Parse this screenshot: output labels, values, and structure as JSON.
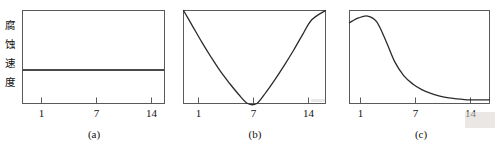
{
  "figure": {
    "y_axis_label": "腐蚀速度",
    "y_axis_label_chars": [
      "腐",
      "蚀",
      "速",
      "度"
    ]
  },
  "panels": [
    {
      "caption": "(a)",
      "tick_labels": [
        "1",
        "7",
        "14"
      ]
    },
    {
      "caption": "(b)",
      "tick_labels": [
        "1",
        "7",
        "14"
      ]
    },
    {
      "caption": "(c)",
      "tick_labels": [
        "1",
        "7",
        "14"
      ]
    }
  ],
  "chart_data": [
    {
      "type": "line",
      "title": "(a)",
      "xlabel": "pH",
      "ylabel": "腐蚀速度",
      "xticks": [
        1,
        7,
        14
      ],
      "xlim": [
        0,
        15.5
      ],
      "ylim": [
        0,
        1
      ],
      "grid": false,
      "legend": "none",
      "annotation": "corrosion rate independent of pH (constant)",
      "series": [
        {
          "name": "corrosion rate",
          "x": [
            0,
            1,
            2,
            3,
            4,
            5,
            6,
            7,
            8,
            9,
            10,
            11,
            12,
            13,
            14,
            15.5
          ],
          "values": [
            0.36,
            0.36,
            0.36,
            0.36,
            0.36,
            0.36,
            0.36,
            0.36,
            0.36,
            0.36,
            0.36,
            0.36,
            0.36,
            0.36,
            0.36,
            0.36
          ]
        }
      ]
    },
    {
      "type": "line",
      "title": "(b)",
      "xlabel": "pH",
      "ylabel": "腐蚀速度",
      "xticks": [
        1,
        7,
        14
      ],
      "xlim": [
        0,
        15.5
      ],
      "ylim": [
        0,
        1
      ],
      "grid": false,
      "legend": "none",
      "annotation": "U-shaped: minimum corrosion rate at neutral pH 7, rises in acid and alkali",
      "series": [
        {
          "name": "corrosion rate",
          "x": [
            0,
            1,
            2,
            3,
            4,
            5,
            6,
            7,
            8,
            9,
            10,
            11,
            12,
            13,
            14,
            15.5
          ],
          "values": [
            1.0,
            0.83,
            0.66,
            0.5,
            0.35,
            0.22,
            0.1,
            0.0,
            0.0,
            0.12,
            0.26,
            0.41,
            0.57,
            0.74,
            0.9,
            1.0
          ]
        }
      ]
    },
    {
      "type": "line",
      "title": "(c)",
      "xlabel": "pH",
      "ylabel": "腐蚀速度",
      "xticks": [
        1,
        7,
        14
      ],
      "xlim": [
        0,
        15.5
      ],
      "ylim": [
        0,
        1
      ],
      "grid": false,
      "legend": "none",
      "annotation": "peak near pH 2 then sigmoidal decay to a low plateau at high pH",
      "series": [
        {
          "name": "corrosion rate",
          "x": [
            0,
            1,
            2,
            3,
            4,
            5,
            6,
            7,
            8,
            9,
            10,
            11,
            12,
            13,
            14,
            15.5
          ],
          "values": [
            0.87,
            0.92,
            0.94,
            0.88,
            0.68,
            0.45,
            0.3,
            0.21,
            0.15,
            0.11,
            0.08,
            0.06,
            0.05,
            0.04,
            0.04,
            0.04
          ]
        }
      ]
    }
  ]
}
